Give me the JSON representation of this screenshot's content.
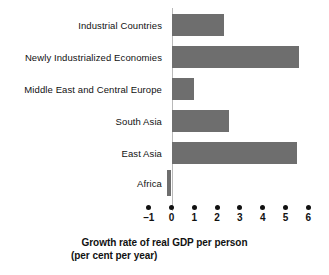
{
  "chart_data": {
    "type": "bar",
    "orientation": "horizontal",
    "title": "",
    "xlabel": "Growth rate of real GDP per person (per cent per year)",
    "ylabel": "",
    "xlim": [
      -1,
      6
    ],
    "grid": false,
    "legend": null,
    "bar_color": "#6e6e6e",
    "categories": [
      "Industrial Countries",
      "Newly Industrialized Economies",
      "Middle East and Central Europe",
      "South Asia",
      "East Asia",
      "Africa"
    ],
    "values": [
      2.3,
      5.6,
      1.0,
      2.5,
      5.5,
      -0.2
    ],
    "xticks": [
      -1,
      0,
      1,
      2,
      3,
      4,
      5,
      6
    ],
    "xtick_labels": [
      "–1",
      "0",
      "1",
      "2",
      "3",
      "4",
      "5",
      "6"
    ]
  },
  "axis_title": {
    "line1": "Growth rate of real GDP per person",
    "line2": "(per cent per year)"
  }
}
